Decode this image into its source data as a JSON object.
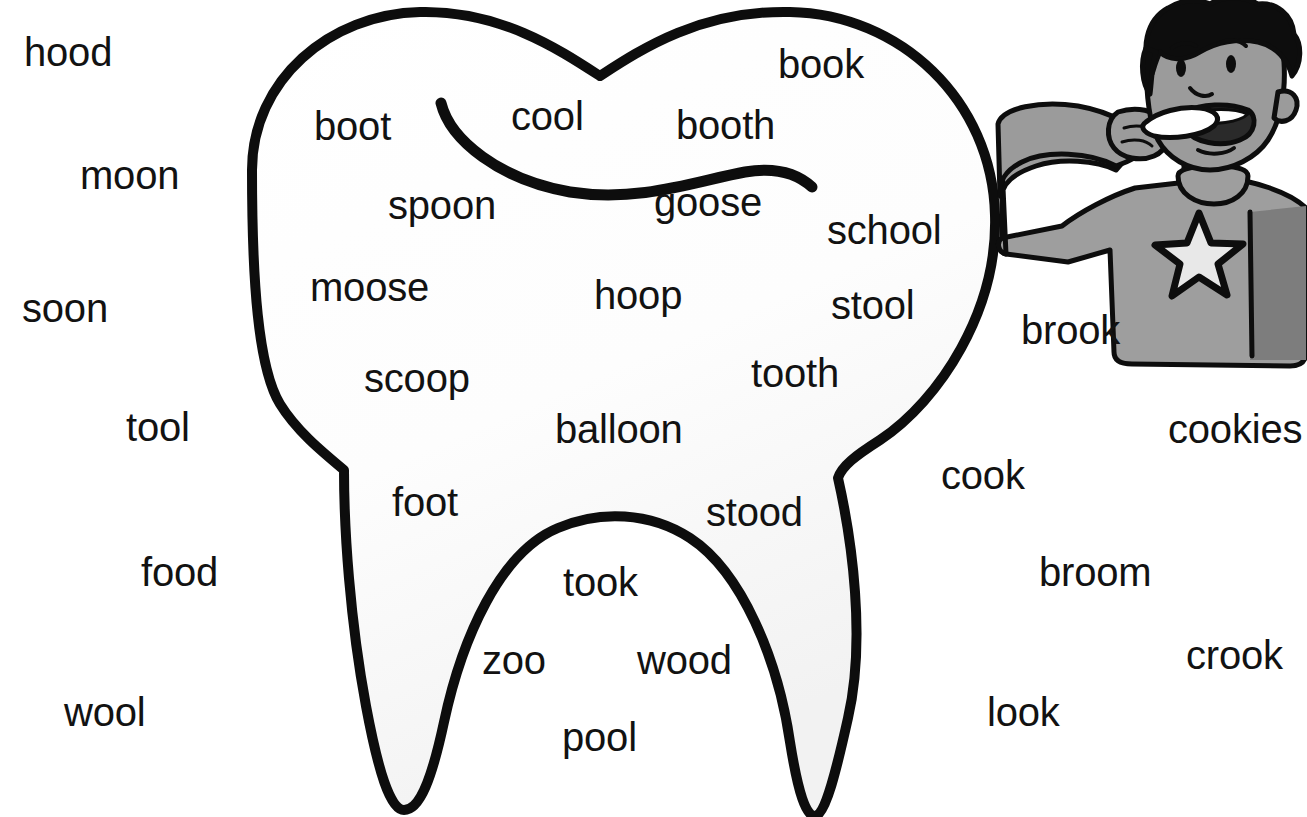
{
  "page": {
    "background_color": "#ffffff",
    "text_color": "#121212"
  },
  "illustration": {
    "tooth": {
      "name": "tooth-outline",
      "outline_color": "#0d0d0d",
      "fill_color": "#fdfdfd",
      "description": "Large molar tooth with two-bump crown, two roots, and an interior S-curve line"
    },
    "boy": {
      "name": "boy-brushing-teeth",
      "hair_color": "#0d0d0d",
      "skin_color": "#9b9b9b",
      "shirt_color": "#9e9e9e",
      "shirt_shadow_color": "#7d7d7d",
      "star_color": "#e8e8e8",
      "toothbrush_color": "#ffffff",
      "description": "Cartoon boy with curly dark hair brushing his teeth, wearing a gray t-shirt with a star"
    }
  },
  "words": {
    "outside_left": [
      {
        "text": "hood",
        "x": 24,
        "y": 32
      },
      {
        "text": "moon",
        "x": 80,
        "y": 155
      },
      {
        "text": "soon",
        "x": 22,
        "y": 288
      },
      {
        "text": "tool",
        "x": 126,
        "y": 407
      },
      {
        "text": "food",
        "x": 141,
        "y": 552
      },
      {
        "text": "wool",
        "x": 64,
        "y": 692
      }
    ],
    "outside_right": [
      {
        "text": "brook",
        "x": 1021,
        "y": 310
      },
      {
        "text": "cookies",
        "x": 1168,
        "y": 409
      },
      {
        "text": "cook",
        "x": 941,
        "y": 455
      },
      {
        "text": "broom",
        "x": 1039,
        "y": 552
      },
      {
        "text": "crook",
        "x": 1186,
        "y": 635
      },
      {
        "text": "look",
        "x": 987,
        "y": 692
      }
    ],
    "inside_tooth": [
      {
        "text": "boot",
        "x": 314,
        "y": 106
      },
      {
        "text": "cool",
        "x": 511,
        "y": 96
      },
      {
        "text": "book",
        "x": 778,
        "y": 44
      },
      {
        "text": "booth",
        "x": 676,
        "y": 105
      },
      {
        "text": "spoon",
        "x": 388,
        "y": 185
      },
      {
        "text": "goose",
        "x": 654,
        "y": 182
      },
      {
        "text": "school",
        "x": 827,
        "y": 210
      },
      {
        "text": "moose",
        "x": 310,
        "y": 267
      },
      {
        "text": "hoop",
        "x": 594,
        "y": 275
      },
      {
        "text": "stool",
        "x": 831,
        "y": 285
      },
      {
        "text": "scoop",
        "x": 364,
        "y": 358
      },
      {
        "text": "tooth",
        "x": 751,
        "y": 353
      },
      {
        "text": "balloon",
        "x": 555,
        "y": 409
      },
      {
        "text": "foot",
        "x": 392,
        "y": 482
      },
      {
        "text": "stood",
        "x": 706,
        "y": 492
      },
      {
        "text": "took",
        "x": 563,
        "y": 562
      },
      {
        "text": "zoo",
        "x": 482,
        "y": 640
      },
      {
        "text": "wood",
        "x": 637,
        "y": 640
      },
      {
        "text": "pool",
        "x": 562,
        "y": 717
      }
    ]
  }
}
